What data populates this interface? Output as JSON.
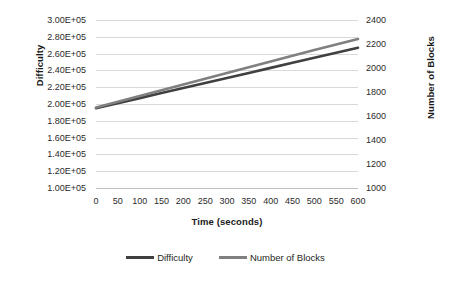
{
  "chart_data": {
    "type": "line",
    "title": "",
    "xlabel": "Time (seconds)",
    "ylabel": "Difficulty",
    "y2label": "Number of Blocks",
    "xlim": [
      0,
      600
    ],
    "ylim": [
      100000,
      300000
    ],
    "y2lim": [
      1000,
      2400
    ],
    "grid": true,
    "legend_position": "bottom",
    "x_tick_labels": [
      "0",
      "50",
      "100",
      "150",
      "200",
      "250",
      "300",
      "350",
      "400",
      "450",
      "500",
      "550",
      "600"
    ],
    "x_ticks": [
      0,
      50,
      100,
      150,
      200,
      250,
      300,
      350,
      400,
      450,
      500,
      550,
      600
    ],
    "y_tick_labels": [
      "3.00E+05",
      "2.80E+05",
      "2.60E+05",
      "2.40E+05",
      "2.20E+05",
      "2.00E+05",
      "1.80E+05",
      "1.60E+05",
      "1.40E+05",
      "1.20E+05",
      "1.00E+05"
    ],
    "y_ticks": [
      300000,
      280000,
      260000,
      240000,
      220000,
      200000,
      180000,
      160000,
      140000,
      120000,
      100000
    ],
    "y2_tick_labels": [
      "2400",
      "2200",
      "2000",
      "1800",
      "1600",
      "1400",
      "1200",
      "1000"
    ],
    "y2_ticks": [
      2400,
      2200,
      2000,
      1800,
      1600,
      1400,
      1200,
      1000
    ],
    "x": [
      0,
      50,
      100,
      150,
      200,
      250,
      300,
      350,
      400,
      450,
      500,
      550,
      600
    ],
    "series": [
      {
        "name": "Difficulty",
        "axis": "left",
        "color": "#404040",
        "values": [
          195000,
          201000,
          207000,
          213000,
          219000,
          225000,
          231000,
          237000,
          243000,
          249000,
          255000,
          261000,
          267000
        ]
      },
      {
        "name": "Number of Blocks",
        "axis": "right",
        "color": "#808080",
        "values": [
          1670,
          1718,
          1766,
          1814,
          1862,
          1910,
          1958,
          2006,
          2054,
          2102,
          2150,
          2196,
          2242
        ]
      }
    ]
  },
  "legend": {
    "entries": [
      {
        "label": "Difficulty",
        "color": "#404040"
      },
      {
        "label": "Number of Blocks",
        "color": "#808080"
      }
    ]
  },
  "colors": {
    "background": "#ffffff",
    "gridline": "#d9d9d9",
    "text": "#231f20",
    "difficulty_line": "#404040",
    "blocks_line": "#808080"
  }
}
